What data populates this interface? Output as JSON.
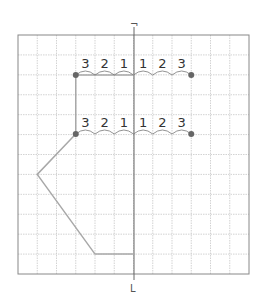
{
  "diagram": {
    "grid": {
      "left": 18,
      "top": 35,
      "right": 249,
      "bottom": 274,
      "cols": 12,
      "rows": 12,
      "line_color": "#c8c8c8",
      "border_color": "#888888"
    },
    "axis": {
      "x": 134,
      "top_label": "¬",
      "bottom_label": "L"
    },
    "rows_of_counts": [
      {
        "y": 75,
        "labels": [
          "3",
          "2",
          "1",
          "1",
          "2",
          "3"
        ]
      },
      {
        "y": 134,
        "labels": [
          "3",
          "2",
          "1",
          "1",
          "2",
          "3"
        ]
      }
    ],
    "shape_color": "#a8a8a8",
    "dot_color": "#666666"
  }
}
